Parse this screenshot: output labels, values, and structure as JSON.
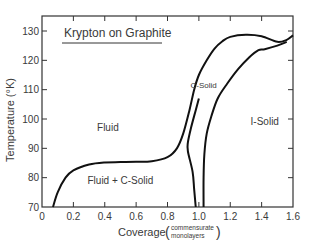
{
  "chart_data": {
    "type": "line",
    "title": "Krypton on Graphite",
    "xlabel": "Coverage",
    "xlabel_units_top": "commensurate",
    "xlabel_units_bottom": "monolayers",
    "ylabel": "Temperature (°K)",
    "xlim": [
      0,
      1.6
    ],
    "ylim": [
      70,
      132
    ],
    "x_ticks": [
      "0",
      "0.2",
      "0.4",
      "0.6",
      "0.8",
      "1.0",
      "1.2",
      "1.4",
      "1.6"
    ],
    "y_ticks": [
      "70",
      "80",
      "90",
      "100",
      "110",
      "120",
      "130"
    ],
    "grid": false,
    "region_labels": [
      {
        "text": "Fluid",
        "x": 0.42,
        "y": 96
      },
      {
        "text": "Fluid + C-Solid",
        "x": 0.5,
        "y": 78
      },
      {
        "text": "C-Solid",
        "x": 1.03,
        "y": 110.5
      },
      {
        "text": "I-Solid",
        "x": 1.42,
        "y": 98
      }
    ],
    "series": [
      {
        "name": "Fluid / Fluid+C-Solid boundary (left)",
        "x": [
          0.07,
          0.1,
          0.15,
          0.2,
          0.3,
          0.4,
          0.5,
          0.6,
          0.7,
          0.8,
          0.86,
          0.9,
          0.94,
          0.97,
          1.0,
          1.05,
          1.1,
          1.15,
          1.2,
          1.3,
          1.4,
          1.5,
          1.56,
          1.6
        ],
        "y": [
          70,
          75,
          80,
          82.5,
          84.5,
          85.2,
          85.3,
          85.4,
          85.6,
          87,
          90,
          95,
          103,
          110,
          115,
          120,
          124,
          126.5,
          128,
          128.7,
          128.2,
          126.3,
          127,
          128.5
        ]
      },
      {
        "name": "C-Solid lower/right boundary",
        "x": [
          0.98,
          0.97,
          0.96,
          0.93,
          0.93,
          0.95,
          0.98,
          1.0
        ],
        "y": [
          70,
          76,
          82,
          89,
          92,
          97,
          103,
          107
        ]
      },
      {
        "name": "C-Solid / I-Solid boundary",
        "x": [
          1.03,
          1.03,
          1.035,
          1.05,
          1.08,
          1.12,
          1.18,
          1.25,
          1.32,
          1.38,
          1.42,
          1.5,
          1.56
        ],
        "y": [
          70,
          80,
          88,
          95,
          101,
          107,
          112,
          117,
          121,
          123.5,
          123.8,
          125,
          126.3
        ]
      }
    ]
  }
}
